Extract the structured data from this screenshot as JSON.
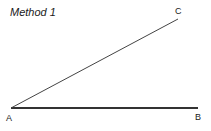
{
  "title": "Method 1",
  "points": {
    "A": {
      "label": "A",
      "x": 11,
      "y": 108
    },
    "B": {
      "label": "B",
      "x": 198,
      "y": 108
    },
    "C": {
      "label": "C",
      "x": 178,
      "y": 19
    }
  },
  "segments": [
    {
      "from": "A",
      "to": "B",
      "weight": "thick"
    },
    {
      "from": "A",
      "to": "C",
      "weight": "thin"
    }
  ],
  "colors": {
    "line": "#333333",
    "text": "#1a1a1a",
    "background": "#ffffff"
  }
}
